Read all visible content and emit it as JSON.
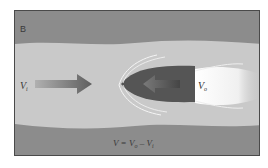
{
  "figure": {
    "panel_label": "B",
    "labels": {
      "water_velocity": {
        "main": "V",
        "sub": "i"
      },
      "jet_velocity": {
        "main": "V",
        "sub": "o"
      },
      "equation": {
        "lhs": "V",
        "eq": " = ",
        "v1": "V",
        "v1_sub": "o",
        "minus": " – ",
        "v2": "V",
        "v2_sub": "i"
      }
    },
    "colors": {
      "outer_band": "#8c8c8c",
      "channel": "#c9c9c9",
      "body": "#555555",
      "arrow": "#6e6e6e",
      "jet": "#f2f2f2",
      "border": "#4a4a4a"
    }
  }
}
